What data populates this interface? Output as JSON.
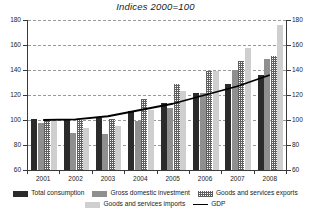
{
  "chart_data": {
    "type": "bar",
    "title": "Indices 2000=100",
    "xlabel": "",
    "ylabel": "",
    "ylim": [
      60,
      180
    ],
    "yticks": [
      60,
      80,
      100,
      120,
      140,
      160,
      180
    ],
    "grid": true,
    "legend_position": "bottom",
    "categories": [
      "2001",
      "2002",
      "2003",
      "2004",
      "2005",
      "2006",
      "2007",
      "2008"
    ],
    "series": [
      {
        "name": "Total consumption",
        "values": [
          101,
          100,
          102,
          107,
          114,
          122,
          129,
          136
        ]
      },
      {
        "name": "Gross domestic investment",
        "values": [
          98,
          90,
          89,
          99,
          110,
          122,
          140,
          149
        ]
      },
      {
        "name": "Goods and services exports",
        "values": [
          100,
          100,
          101,
          117,
          129,
          139,
          147,
          151
        ]
      },
      {
        "name": "Goods and services imports",
        "values": [
          99,
          94,
          95,
          108,
          123,
          139,
          158,
          176
        ]
      }
    ],
    "line_series": [
      {
        "name": "GDP",
        "values": [
          100,
          100.5,
          103,
          108,
          113,
          120,
          127,
          136
        ]
      }
    ],
    "axis_labels_left": [
      "180",
      "160",
      "140",
      "120",
      "100",
      "80",
      "60"
    ],
    "axis_labels_right": [
      "180",
      "160",
      "140",
      "120",
      "100",
      "80",
      "60"
    ]
  },
  "legend": {
    "items": [
      {
        "label": "Total consumption",
        "swatch": "dark-solid-swatch"
      },
      {
        "label": "Gross domestic investment",
        "swatch": "gray-solid-swatch"
      },
      {
        "label": "Goods and services exports",
        "swatch": "hatched-swatch"
      },
      {
        "label": "Goods and services imports",
        "swatch": "light-gray-swatch"
      },
      {
        "label": "GDP",
        "swatch": "black-line-swatch"
      }
    ]
  }
}
